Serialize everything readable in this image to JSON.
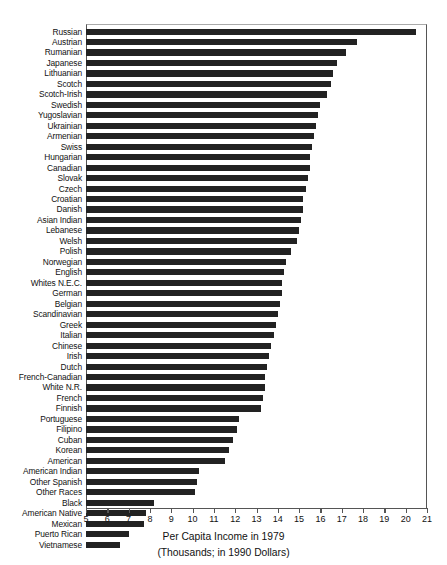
{
  "chart_data": {
    "type": "bar",
    "orientation": "horizontal",
    "title": "",
    "xlabel": "Per Capita Income in 1979",
    "xlabel_sub": "(Thousands; in 1990 Dollars)",
    "ylabel": "",
    "xlim": [
      5,
      21
    ],
    "grid": false,
    "legend": null,
    "bar_color": "#222222",
    "axis_color": "#555555",
    "xticks": [
      5,
      6,
      7,
      8,
      9,
      10,
      11,
      12,
      13,
      14,
      15,
      16,
      17,
      18,
      19,
      20,
      21
    ],
    "xtick_labels": [
      "5",
      "6",
      "7",
      "8",
      "9",
      "10",
      "11",
      "12",
      "13",
      "14",
      "15",
      "16",
      "17",
      "18",
      "19",
      "20",
      "21"
    ],
    "categories": [
      "Russian",
      "Austrian",
      "Rumanian",
      "Japanese",
      "Lithuanian",
      "Scotch",
      "Scotch-Irish",
      "Swedish",
      "Yugoslavian",
      "Ukrainian",
      "Armenian",
      "Swiss",
      "Hungarian",
      "Canadian",
      "Slovak",
      "Czech",
      "Croatian",
      "Danish",
      "Asian Indian",
      "Lebanese",
      "Welsh",
      "Polish",
      "Norwegian",
      "English",
      "Whites N.E.C.",
      "German",
      "Belgian",
      "Scandinavian",
      "Greek",
      "Italian",
      "Chinese",
      "Irish",
      "Dutch",
      "French-Canadian",
      "White N.R.",
      "French",
      "Finnish",
      "Portuguese",
      "Filipino",
      "Cuban",
      "Korean",
      "American",
      "American Indian",
      "Other Spanish",
      "Other Races",
      "Black",
      "American Native",
      "Mexican",
      "Puerto Rican",
      "Vietnamese"
    ],
    "values": [
      20.5,
      17.7,
      17.2,
      16.8,
      16.6,
      16.5,
      16.3,
      16.0,
      15.9,
      15.8,
      15.7,
      15.6,
      15.5,
      15.5,
      15.4,
      15.3,
      15.2,
      15.2,
      15.1,
      15.0,
      14.9,
      14.6,
      14.4,
      14.3,
      14.2,
      14.2,
      14.1,
      14.0,
      13.9,
      13.8,
      13.7,
      13.6,
      13.5,
      13.4,
      13.4,
      13.3,
      13.2,
      12.2,
      12.1,
      11.9,
      11.7,
      11.5,
      10.3,
      10.2,
      10.1,
      8.2,
      7.8,
      7.7,
      7.0,
      6.6
    ]
  }
}
